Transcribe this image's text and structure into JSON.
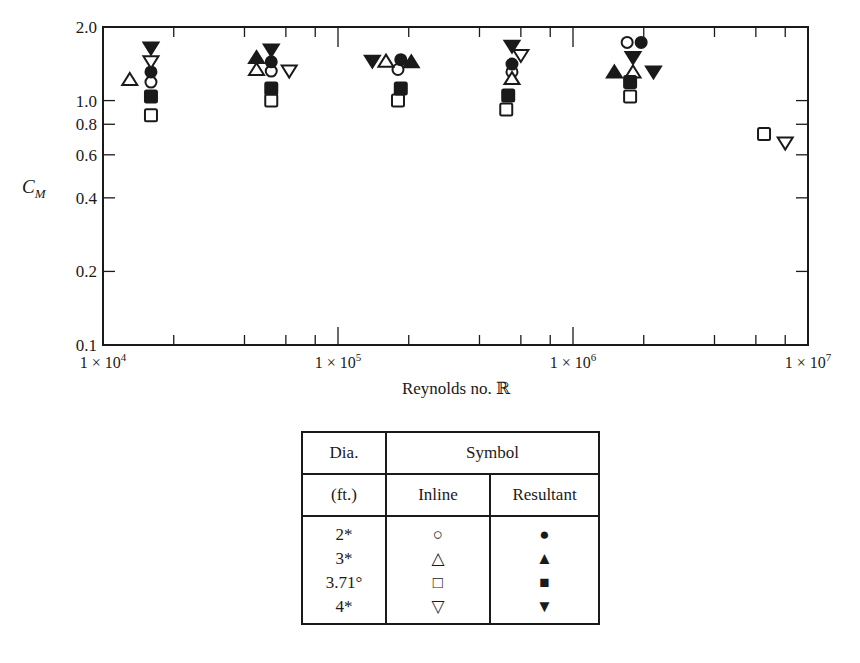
{
  "chart_data": {
    "type": "scatter",
    "title": "",
    "xlabel": "Reynolds no. ℝ",
    "ylabel": "C_M",
    "xscale": "log",
    "yscale": "log",
    "xlim": [
      10000,
      10000000
    ],
    "ylim": [
      0.1,
      2.0
    ],
    "x_tick_labels": [
      "1 × 10^4",
      "1 × 10^5",
      "1 × 10^6",
      "1 × 10^7"
    ],
    "y_tick_labels": [
      "0.1",
      "0.2",
      "0.4",
      "0.6",
      "0.8",
      "1.0",
      "2.0"
    ],
    "grid": false,
    "legend_position": "table below plot",
    "series": [
      {
        "name": "2* Inline",
        "marker": "circle-open",
        "points": [
          [
            16000,
            1.19
          ],
          [
            52000,
            1.32
          ],
          [
            180000,
            1.34
          ],
          [
            550000,
            1.31
          ],
          [
            1700000,
            1.73
          ]
        ]
      },
      {
        "name": "2* Resultant",
        "marker": "circle-filled",
        "points": [
          [
            16000,
            1.31
          ],
          [
            52000,
            1.44
          ],
          [
            185000,
            1.47
          ],
          [
            550000,
            1.41
          ],
          [
            1950000,
            1.73
          ]
        ]
      },
      {
        "name": "3* Inline",
        "marker": "triangle-up-open",
        "points": [
          [
            13000,
            1.22
          ],
          [
            45000,
            1.34
          ],
          [
            160000,
            1.45
          ],
          [
            550000,
            1.23
          ],
          [
            1800000,
            1.31
          ]
        ]
      },
      {
        "name": "3* Resultant",
        "marker": "triangle-up-filled",
        "points": [
          [
            45000,
            1.5
          ],
          [
            205000,
            1.44
          ],
          [
            1500000,
            1.31
          ]
        ]
      },
      {
        "name": "3.71° Inline",
        "marker": "square-open",
        "points": [
          [
            16000,
            0.87
          ],
          [
            52000,
            1.0
          ],
          [
            180000,
            1.0
          ],
          [
            520000,
            0.92
          ],
          [
            1750000,
            1.04
          ],
          [
            6500000,
            0.73
          ]
        ]
      },
      {
        "name": "3.71° Resultant",
        "marker": "square-filled",
        "points": [
          [
            16000,
            1.04
          ],
          [
            52000,
            1.12
          ],
          [
            185000,
            1.12
          ],
          [
            530000,
            1.05
          ],
          [
            1750000,
            1.19
          ]
        ]
      },
      {
        "name": "4* Inline",
        "marker": "triangle-down-open",
        "points": [
          [
            16000,
            1.44
          ],
          [
            62000,
            1.32
          ],
          [
            600000,
            1.53
          ],
          [
            8000000,
            0.67
          ]
        ]
      },
      {
        "name": "4* Resultant",
        "marker": "triangle-down-filled",
        "points": [
          [
            16000,
            1.64
          ],
          [
            52000,
            1.61
          ],
          [
            140000,
            1.45
          ],
          [
            550000,
            1.67
          ],
          [
            1800000,
            1.5
          ],
          [
            2200000,
            1.31
          ]
        ]
      }
    ]
  },
  "legend_table": {
    "header_row1": [
      "Dia.",
      "Symbol"
    ],
    "header_row2": [
      "(ft.)",
      "Inline",
      "Resultant"
    ],
    "rows": [
      {
        "dia": "2*",
        "inline": "○",
        "resultant": "●"
      },
      {
        "dia": "3*",
        "inline": "△",
        "resultant": "▲"
      },
      {
        "dia": "3.71°",
        "inline": "□",
        "resultant": "■"
      },
      {
        "dia": "4*",
        "inline": "▽",
        "resultant": "▼"
      }
    ]
  },
  "colors": {
    "ink": "#1a1a1a",
    "background": "#ffffff"
  }
}
